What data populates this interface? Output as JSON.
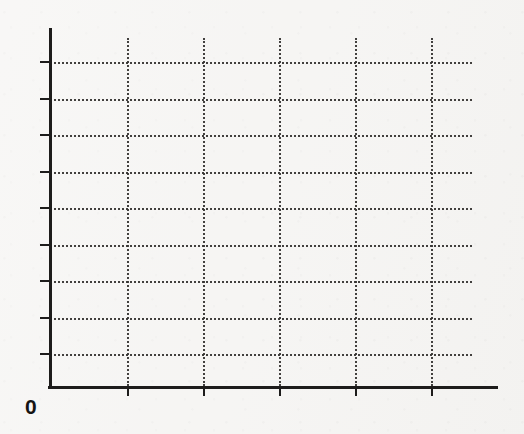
{
  "chart_data": {
    "type": "line",
    "title": "",
    "subtitle": "",
    "xlabel": "",
    "ylabel": "",
    "series": [],
    "categories": [],
    "x": [],
    "values": [],
    "annotations": [
      {
        "text": "0",
        "role": "origin-label"
      }
    ],
    "legend": {
      "entries": [],
      "position": "none"
    },
    "grid": {
      "visible": true,
      "style": "dotted",
      "color": "#33312f",
      "horizontal_count": 9,
      "vertical_count": 5
    },
    "axes": {
      "color": "#1d1c1b",
      "origin_label": "0",
      "x": {
        "line_y": 386,
        "line_x_start": 48,
        "line_x_end": 498,
        "tick_positions_px": [
          127,
          203,
          279,
          355,
          431
        ],
        "tick_labels": [
          "",
          "",
          "",
          "",
          ""
        ],
        "tick_direction": "down",
        "tick_length_px": 7
      },
      "y": {
        "line_x": 49,
        "line_y_start": 28,
        "line_y_end": 386,
        "tick_positions_px": [
          62,
          99,
          135,
          172,
          208,
          245,
          281,
          318,
          354
        ],
        "tick_labels": [
          "",
          "",
          "",
          "",
          "",
          "",
          "",
          "",
          ""
        ],
        "tick_direction": "left",
        "tick_length_px": 9
      }
    },
    "gridlines": {
      "horizontal_y_px": [
        62,
        99,
        135,
        172,
        208,
        245,
        281,
        318,
        354
      ],
      "horizontal_x_start": 49,
      "horizontal_x_end": 472,
      "vertical_x_px": [
        127,
        203,
        279,
        355,
        431
      ],
      "vertical_y_start": 38,
      "vertical_y_end": 386
    },
    "background_color": "#f6f5f3"
  },
  "canvas": {
    "width": 524,
    "height": 434
  }
}
